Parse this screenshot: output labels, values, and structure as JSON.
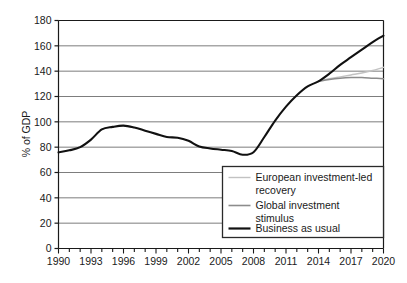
{
  "chart_data": {
    "type": "line",
    "title": "",
    "xlabel": "",
    "ylabel": "% of GDP",
    "xlim": [
      1990,
      2020
    ],
    "ylim": [
      0,
      180
    ],
    "grid": true,
    "legend_position": "inside-bottom-right",
    "x_tick_labels": [
      "1990",
      "1993",
      "1996",
      "1999",
      "2002",
      "2005",
      "2008",
      "2011",
      "2014",
      "2017",
      "2020"
    ],
    "x_tick_values": [
      1990,
      1993,
      1996,
      1999,
      2002,
      2005,
      2008,
      2011,
      2014,
      2017,
      2020
    ],
    "x_minor_tick_values": [
      1990,
      1991,
      1992,
      1993,
      1994,
      1995,
      1996,
      1997,
      1998,
      1999,
      2000,
      2001,
      2002,
      2003,
      2004,
      2005,
      2006,
      2007,
      2008,
      2009,
      2010,
      2011,
      2012,
      2013,
      2014,
      2015,
      2016,
      2017,
      2018,
      2019,
      2020
    ],
    "y_tick_labels": [
      "0",
      "20",
      "40",
      "60",
      "80",
      "100",
      "120",
      "140",
      "160",
      "180"
    ],
    "y_tick_values": [
      0,
      20,
      40,
      60,
      80,
      100,
      120,
      140,
      160,
      180
    ],
    "x": [
      1990,
      1991,
      1992,
      1993,
      1994,
      1995,
      1996,
      1997,
      1998,
      1999,
      2000,
      2001,
      2002,
      2003,
      2004,
      2005,
      2006,
      2007,
      2008,
      2009,
      2010,
      2011,
      2012,
      2013,
      2014,
      2015,
      2016,
      2017,
      2018,
      2019,
      2020
    ],
    "series": [
      {
        "name": "Business as usual",
        "color": "#111111",
        "width": 2.1,
        "values": [
          76,
          77.5,
          80,
          86,
          94,
          96,
          97,
          95.5,
          93,
          90.5,
          88,
          87.5,
          85,
          80.5,
          79,
          78,
          77,
          74,
          76,
          88,
          101,
          112,
          121,
          128,
          132,
          138,
          145,
          151,
          157,
          163,
          168
        ]
      },
      {
        "name": "Global investment stimulus",
        "color": "#8c8c8c",
        "width": 1.5,
        "values": [
          null,
          null,
          null,
          null,
          null,
          null,
          null,
          null,
          null,
          null,
          null,
          null,
          null,
          null,
          null,
          null,
          null,
          null,
          null,
          null,
          null,
          null,
          null,
          null,
          132,
          133.5,
          134.5,
          135,
          135,
          134.5,
          134
        ]
      },
      {
        "name": "European investment-led recovery",
        "color": "#c2c2c2",
        "width": 1.5,
        "values": [
          null,
          null,
          null,
          null,
          null,
          null,
          null,
          null,
          null,
          null,
          null,
          null,
          null,
          null,
          null,
          null,
          null,
          null,
          null,
          null,
          null,
          null,
          null,
          null,
          132,
          134,
          135.5,
          137,
          138.5,
          140.5,
          143
        ]
      }
    ],
    "legend_entries": [
      {
        "label_line1": "European investment-led",
        "label_line2": "recovery",
        "color": "#c2c2c2",
        "width": 1.4,
        "name": "european-investment-led-recovery"
      },
      {
        "label_line1": "Global investment",
        "label_line2": "stimulus",
        "color": "#8c8c8c",
        "width": 1.6,
        "name": "global-investment-stimulus"
      },
      {
        "label_line1": "Business as usual",
        "label_line2": "",
        "color": "#111111",
        "width": 2.2,
        "name": "business-as-usual"
      }
    ]
  },
  "colors": {
    "grid": "#7d7d7d",
    "axis": "#1a1a1a",
    "legend_border": "#2a2a2a",
    "background": "#ffffff"
  }
}
